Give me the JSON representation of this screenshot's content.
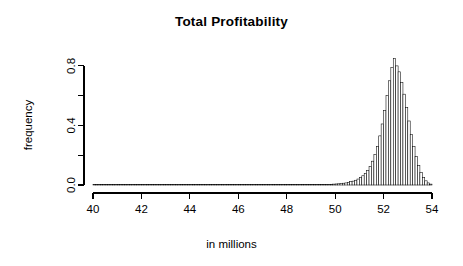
{
  "figure": {
    "title": "Total Profitability",
    "background_color": "#ffffff",
    "foreground_color": "#000000"
  },
  "chart_data": {
    "type": "bar",
    "subtype": "histogram",
    "title": "Total Profitability",
    "subtitle": "",
    "xlabel": "in millions",
    "ylabel": "frequency",
    "xlim": [
      40,
      54
    ],
    "ylim": [
      0,
      0.9
    ],
    "grid": false,
    "legend": null,
    "bar_fill_color": "#ffffff",
    "bar_border_color": "#000000",
    "bin_width": 0.1,
    "x_ticks": [
      40,
      42,
      44,
      46,
      48,
      50,
      52,
      54
    ],
    "x_tick_labels": [
      "40",
      "42",
      "44",
      "46",
      "48",
      "50",
      "52",
      "54"
    ],
    "y_ticks": [
      0.0,
      0.2,
      0.4,
      0.6,
      0.8
    ],
    "y_tick_labels": [
      "0.0",
      "",
      "0.4",
      "",
      "0.8"
    ],
    "y_labeled_ticks": [
      0.0,
      0.4,
      0.8
    ],
    "peak_x": 52.25,
    "peak_y": 0.85,
    "bin_starts": [
      40.0,
      40.1,
      40.2,
      40.3,
      40.4,
      40.5,
      40.6,
      40.7,
      40.8,
      40.9,
      41.0,
      41.1,
      41.2,
      41.3,
      41.4,
      41.5,
      41.6,
      41.7,
      41.8,
      41.9,
      42.0,
      42.1,
      42.2,
      42.3,
      42.4,
      42.5,
      42.6,
      42.7,
      42.8,
      42.9,
      43.0,
      43.1,
      43.2,
      43.3,
      43.4,
      43.5,
      43.6,
      43.7,
      43.8,
      43.9,
      44.0,
      44.1,
      44.2,
      44.3,
      44.4,
      44.5,
      44.6,
      44.7,
      44.8,
      44.9,
      45.0,
      45.1,
      45.2,
      45.3,
      45.4,
      45.5,
      45.6,
      45.7,
      45.8,
      45.9,
      46.0,
      46.1,
      46.2,
      46.3,
      46.4,
      46.5,
      46.6,
      46.7,
      46.8,
      46.9,
      47.0,
      47.1,
      47.2,
      47.3,
      47.4,
      47.5,
      47.6,
      47.7,
      47.8,
      47.9,
      48.0,
      48.1,
      48.2,
      48.3,
      48.4,
      48.5,
      48.6,
      48.7,
      48.8,
      48.9,
      49.0,
      49.1,
      49.2,
      49.3,
      49.4,
      49.5,
      49.6,
      49.7,
      49.8,
      49.9,
      50.0,
      50.1,
      50.2,
      50.3,
      50.4,
      50.5,
      50.6,
      50.7,
      50.8,
      50.9,
      51.0,
      51.1,
      51.2,
      51.3,
      51.4,
      51.5,
      51.6,
      51.7,
      51.8,
      51.9,
      52.0,
      52.1,
      52.2,
      52.3,
      52.4,
      52.5,
      52.6,
      52.7,
      52.8,
      52.9,
      53.0,
      53.1,
      53.2,
      53.3,
      53.4,
      53.5,
      53.6,
      53.7,
      53.8,
      53.9
    ],
    "values": [
      0.0,
      0.0,
      0.0,
      0.0,
      0.0,
      0.0,
      0.0,
      0.0,
      0.0,
      0.0,
      0.0,
      0.0,
      0.0,
      0.0,
      0.0,
      0.0,
      0.0,
      0.0,
      0.0,
      0.0,
      0.0,
      0.0,
      0.0,
      0.0,
      0.0,
      0.0,
      0.0,
      0.0,
      0.0,
      0.0,
      0.0,
      0.0,
      0.0,
      0.0,
      0.0,
      0.0,
      0.0,
      0.0,
      0.0,
      0.0,
      0.0,
      0.0,
      0.0,
      0.0,
      0.0,
      0.0,
      0.0,
      0.0,
      0.0,
      0.0,
      0.0,
      0.0,
      0.0,
      0.0,
      0.0,
      0.0,
      0.0,
      0.0,
      0.0,
      0.0,
      0.0,
      0.0,
      0.0,
      0.0,
      0.0,
      0.0,
      0.0,
      0.0,
      0.0,
      0.0,
      0.0,
      0.0,
      0.0,
      0.0,
      0.0,
      0.0,
      0.0,
      0.0,
      0.0,
      0.0,
      0.0,
      0.0,
      0.0,
      0.0,
      0.0,
      0.0,
      0.0,
      0.0,
      0.0,
      0.0,
      0.0,
      0.0,
      0.0,
      0.0,
      0.003,
      0.003,
      0.004,
      0.004,
      0.005,
      0.006,
      0.007,
      0.008,
      0.01,
      0.012,
      0.014,
      0.018,
      0.022,
      0.026,
      0.032,
      0.04,
      0.05,
      0.062,
      0.078,
      0.098,
      0.125,
      0.16,
      0.205,
      0.26,
      0.33,
      0.41,
      0.5,
      0.6,
      0.7,
      0.79,
      0.85,
      0.8,
      0.76,
      0.69,
      0.61,
      0.52,
      0.43,
      0.34,
      0.26,
      0.19,
      0.13,
      0.085,
      0.05,
      0.028,
      0.014,
      0.006
    ]
  },
  "axes": {
    "x_axis_title": "in millions",
    "y_axis_title": "frequency"
  }
}
